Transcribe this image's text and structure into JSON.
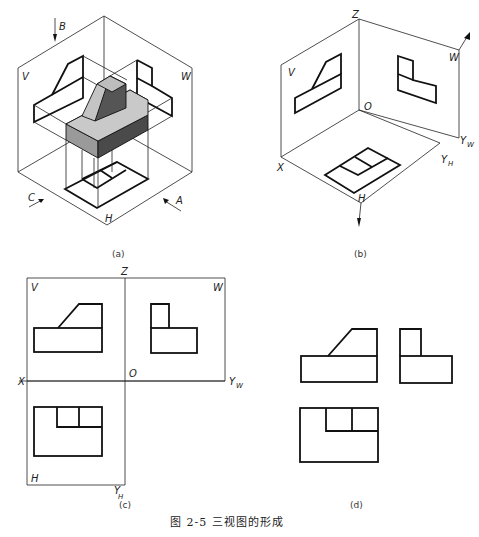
{
  "figure": {
    "caption": "图 2-5   三视图的形成",
    "panels": [
      {
        "id": "a",
        "label": "(a)",
        "description": "Isometric view of object in three-plane projection box",
        "plane_labels": {
          "v": "V",
          "w": "W",
          "h": "H"
        },
        "direction_labels": {
          "b": "B",
          "c": "C",
          "a": "A"
        },
        "colors": {
          "top_face": "#c9c9c9",
          "front_face": "#9a9a9a",
          "side_face": "#4a4a4a"
        }
      },
      {
        "id": "b",
        "label": "(b)",
        "description": "Projections on V, H, W planes",
        "plane_labels": {
          "v": "V",
          "w": "W",
          "h": "H"
        },
        "axis_labels": {
          "z": "Z",
          "o": "O",
          "x": "X",
          "yw": "Y",
          "yw_sub": "W",
          "yh": "Y",
          "yh_sub": "H"
        }
      },
      {
        "id": "c",
        "label": "(c)",
        "description": "Planes unfolded",
        "plane_labels": {
          "v": "V",
          "w": "W",
          "h": "H"
        },
        "axis_labels": {
          "z": "Z",
          "o": "O",
          "x": "X",
          "yw": "Y",
          "yw_sub": "W",
          "yh": "Y",
          "yh_sub": "H"
        }
      },
      {
        "id": "d",
        "label": "(d)",
        "description": "Three views without frames"
      }
    ]
  }
}
